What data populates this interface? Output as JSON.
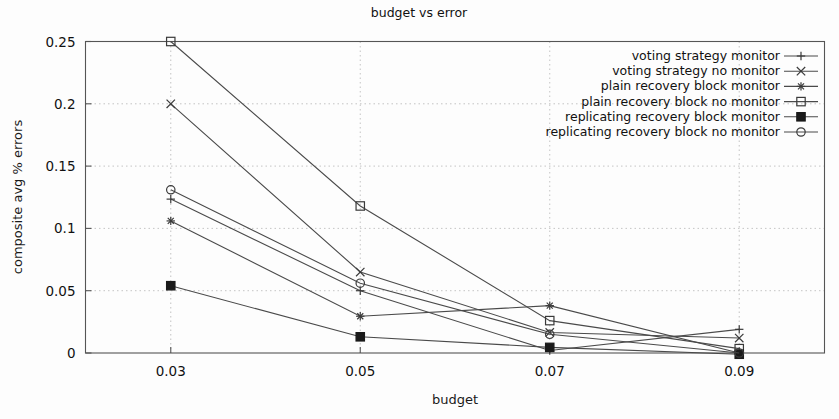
{
  "chart_data": {
    "type": "line",
    "title": "budget vs error",
    "xlabel": "budget",
    "ylabel": "composite avg % errors",
    "x": [
      0.03,
      0.05,
      0.07,
      0.09
    ],
    "xtick_labels": [
      "0.03",
      "0.05",
      "0.07",
      "0.09"
    ],
    "ytick_labels": [
      "0",
      "0.05",
      "0.1",
      "0.15",
      "0.2",
      "0.25"
    ],
    "ytick_values": [
      0,
      0.05,
      0.1,
      0.15,
      0.2,
      0.25
    ],
    "xlim": [
      0.021,
      0.099
    ],
    "ylim": [
      0,
      0.25
    ],
    "grid": true,
    "legend_position": "top-right",
    "series": [
      {
        "name": "voting strategy monitor",
        "marker": "plus",
        "values": [
          0.1235,
          0.05,
          0.002,
          0.019
        ]
      },
      {
        "name": "voting strategy no monitor",
        "marker": "cross",
        "values": [
          0.2,
          0.065,
          0.0165,
          0.012
        ]
      },
      {
        "name": "plain recovery block monitor",
        "marker": "star",
        "values": [
          0.106,
          0.0295,
          0.038,
          0.0
        ]
      },
      {
        "name": "plain recovery block no monitor",
        "marker": "open-square",
        "values": [
          0.25,
          0.118,
          0.026,
          0.0035
        ]
      },
      {
        "name": "replicating recovery block monitor",
        "marker": "filled-square",
        "values": [
          0.054,
          0.013,
          0.0045,
          -0.001
        ]
      },
      {
        "name": "replicating recovery block no monitor",
        "marker": "open-circle",
        "values": [
          0.131,
          0.056,
          0.015,
          0.0
        ]
      }
    ]
  }
}
